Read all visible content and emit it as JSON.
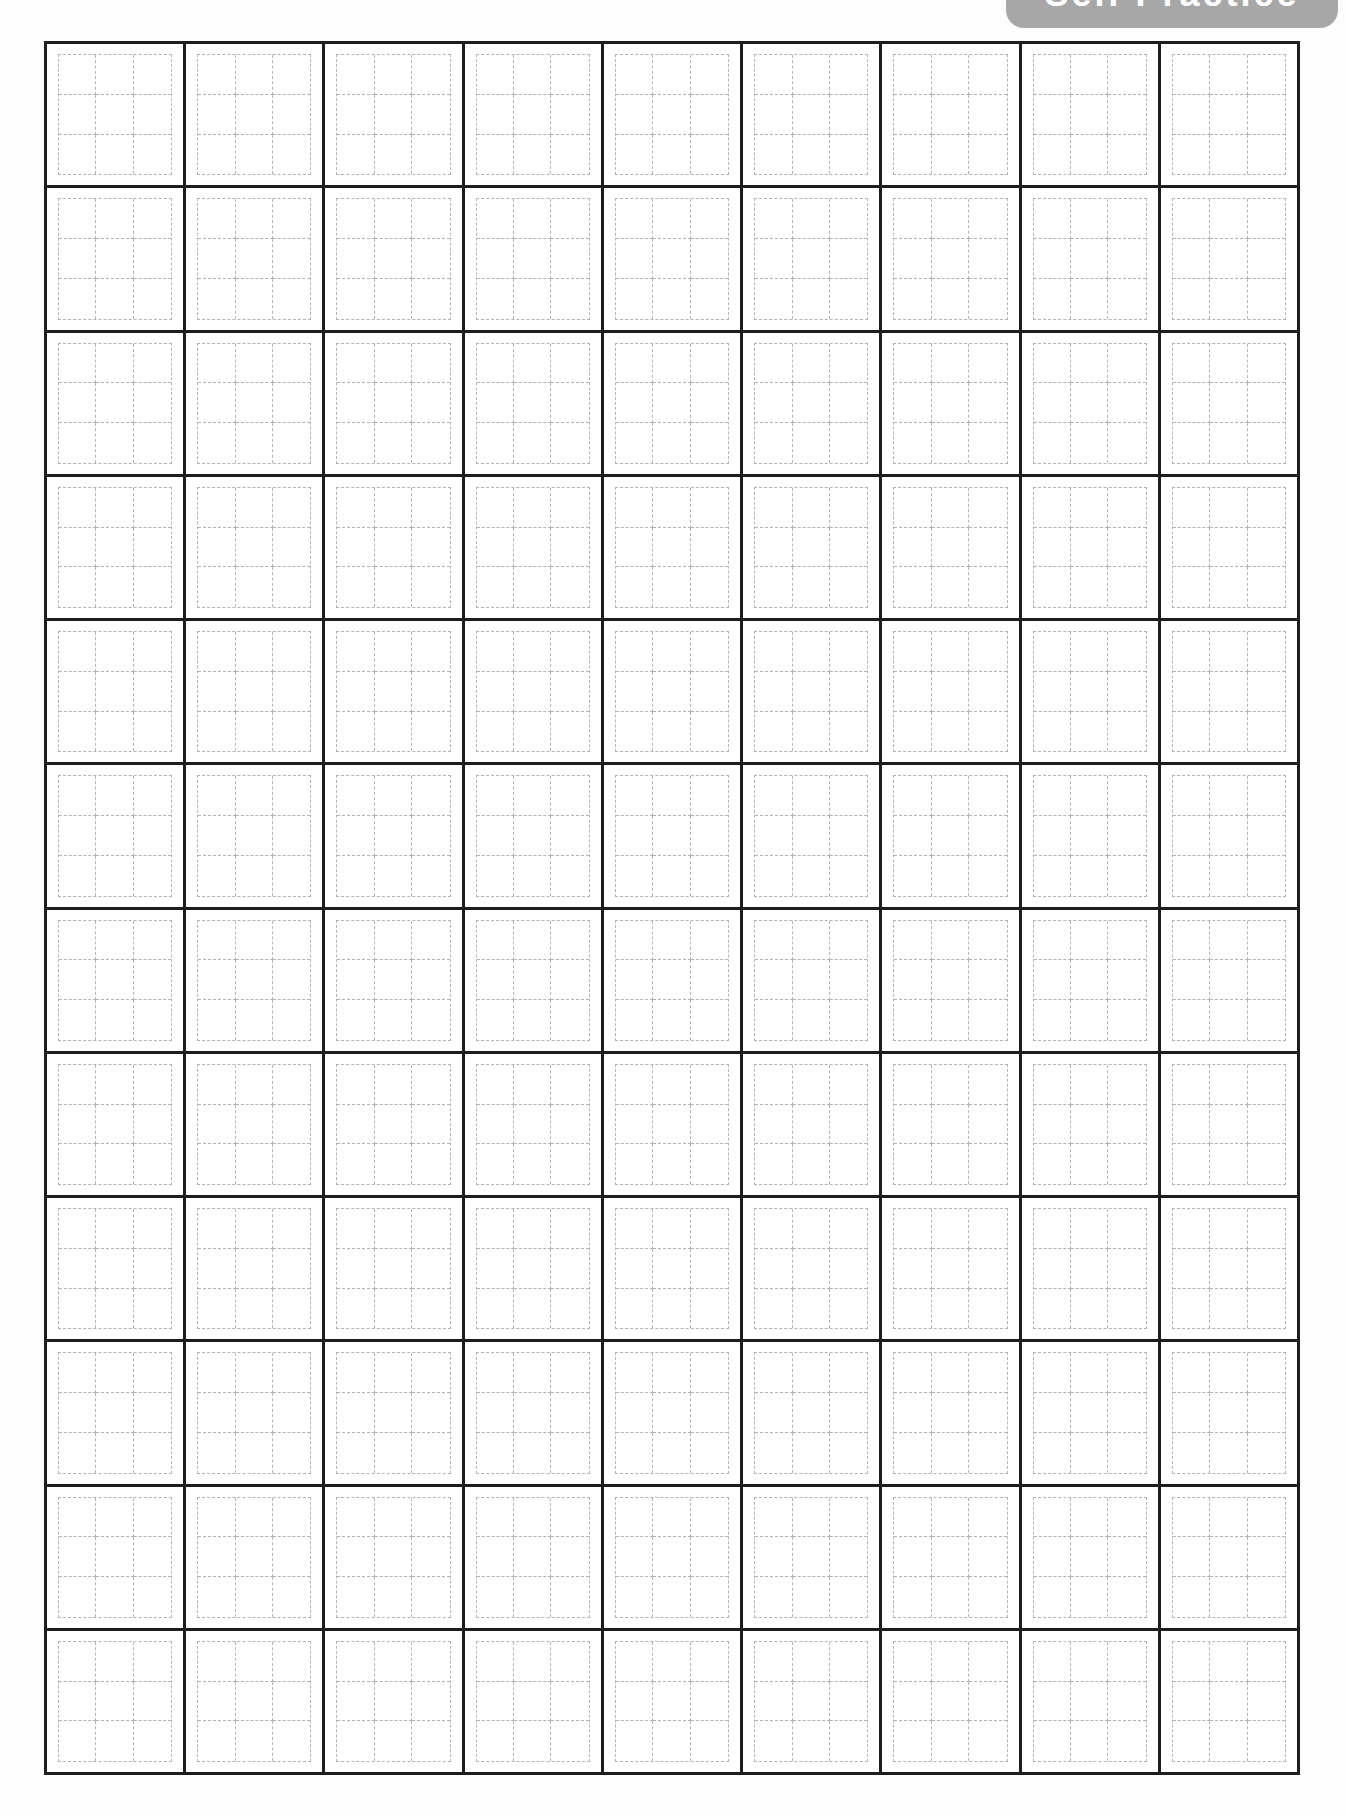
{
  "page": {
    "background": "#fdfdfd"
  },
  "badge": {
    "label": "Self Practice",
    "background": "#a7a7a7",
    "text_color": "#ffffff"
  },
  "grid": {
    "rows": 12,
    "columns": 9,
    "cell_count": 108,
    "line_color": "#1d1d1d",
    "cell_background": "#ffffff",
    "guide_line_color": "#b3b3b3",
    "guide_style": "dashed nine-square (3x3) writing guide",
    "guide_rows": 3,
    "guide_columns": 3
  }
}
